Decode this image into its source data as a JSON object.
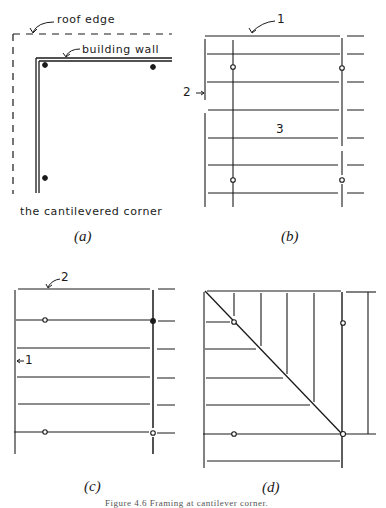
{
  "figure": {
    "caption": "Figure 4.6   Framing at cantilever corner.",
    "panels": [
      {
        "id": "a",
        "label": "(a)",
        "annotations": {
          "roof_edge": "roof edge",
          "building_wall": "building wall",
          "title": "the cantilevered corner"
        }
      },
      {
        "id": "b",
        "label": "(b)",
        "annotations": {
          "callout_1": "1",
          "callout_2": "2",
          "callout_3": "3"
        }
      },
      {
        "id": "c",
        "label": "(c)",
        "annotations": {
          "callout_1": "1",
          "callout_2": "2"
        }
      },
      {
        "id": "d",
        "label": "(d)"
      }
    ]
  },
  "colors": {
    "ink": "#1a1a1a",
    "background": "#ffffff"
  }
}
